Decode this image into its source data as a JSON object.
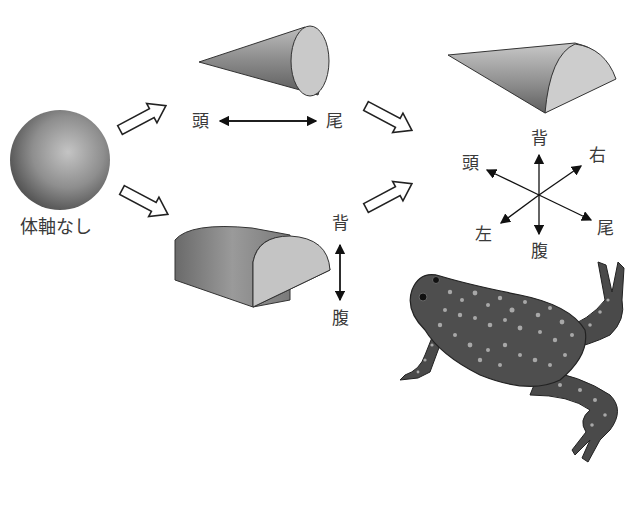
{
  "diagram": {
    "stage1": {
      "shape": "sphere",
      "label": "体軸なし"
    },
    "stage2a": {
      "shape": "cone",
      "axis_labels": {
        "left": "頭",
        "right": "尾"
      },
      "axis_name": "anterior-posterior"
    },
    "stage2b": {
      "shape": "half-cylinder",
      "axis_labels": {
        "top": "背",
        "bottom": "腹"
      },
      "axis_name": "dorsal-ventral"
    },
    "stage3": {
      "shape": "half-cone",
      "axis_labels": {
        "head": "頭",
        "tail": "尾",
        "dorsal": "背",
        "ventral": "腹",
        "right": "右",
        "left": "左"
      }
    },
    "organism": "frog",
    "arrows": [
      {
        "from": "stage1",
        "to": "stage2a"
      },
      {
        "from": "stage1",
        "to": "stage2b"
      },
      {
        "from": "stage2a",
        "to": "stage3"
      },
      {
        "from": "stage2b",
        "to": "stage3"
      }
    ]
  }
}
